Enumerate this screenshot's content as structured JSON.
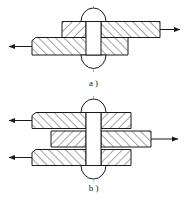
{
  "figure": {
    "background_color": "#ffffff",
    "line_color": "#1a1a1a",
    "hatch_color": "#1a1a1a",
    "centerline_color": "#888888",
    "panels": [
      {
        "id": "a",
        "caption": "a )",
        "joint_type": "single-shear lap riveted joint",
        "plate_count": 2,
        "rivet_count": 1,
        "force_arrows": [
          {
            "name": "left-force-arrow",
            "direction": "left",
            "plate": "lower-plate"
          },
          {
            "name": "right-force-arrow",
            "direction": "right",
            "plate": "upper-plate"
          }
        ]
      },
      {
        "id": "b",
        "caption": "b )",
        "joint_type": "double-shear butt riveted joint with cover plates",
        "plate_count": 3,
        "rivet_count": 1,
        "force_arrows": [
          {
            "name": "left-force-arrow-upper",
            "direction": "left",
            "plate": "upper-cover-plate"
          },
          {
            "name": "left-force-arrow-lower",
            "direction": "left",
            "plate": "lower-cover-plate"
          },
          {
            "name": "right-force-arrow-middle",
            "direction": "right",
            "plate": "middle-plate"
          }
        ]
      }
    ]
  }
}
